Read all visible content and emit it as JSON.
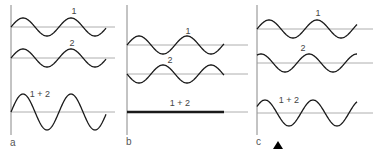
{
  "figure": {
    "type": "wave-interference-diagram",
    "panels": [
      {
        "id": "a",
        "label": "a",
        "description": "constructive interference (in phase)",
        "waves": [
          {
            "label": "1",
            "baseline_y": 27,
            "amplitude": 9,
            "phase": 0
          },
          {
            "label": "2",
            "baseline_y": 58,
            "amplitude": 9,
            "phase": 0
          },
          {
            "label": "1 + 2",
            "baseline_y": 112,
            "amplitude": 18,
            "phase": 0
          }
        ]
      },
      {
        "id": "b",
        "label": "b",
        "description": "destructive interference (180° out of phase)",
        "waves": [
          {
            "label": "1",
            "baseline_y": 45,
            "amplitude": 9,
            "phase": 0
          },
          {
            "label": "2",
            "baseline_y": 74,
            "amplitude": 9,
            "phase": 180
          },
          {
            "label": "1 + 2",
            "baseline_y": 112,
            "amplitude": 0,
            "phase": 0
          }
        ]
      },
      {
        "id": "c",
        "label": "c",
        "description": "partial interference (phase shifted)",
        "marker": "triangle-up",
        "waves": [
          {
            "label": "1",
            "baseline_y": 29,
            "amplitude": 9,
            "phase": 0
          },
          {
            "label": "2",
            "baseline_y": 63,
            "amplitude": 9,
            "phase": 60
          },
          {
            "label": "1 + 2",
            "baseline_y": 113,
            "amplitude": 13,
            "phase": 30
          }
        ]
      }
    ],
    "colors": {
      "wave": "#1a1a1a",
      "axis": "#888888",
      "baseline": "#999999",
      "marker": "#000000"
    }
  }
}
